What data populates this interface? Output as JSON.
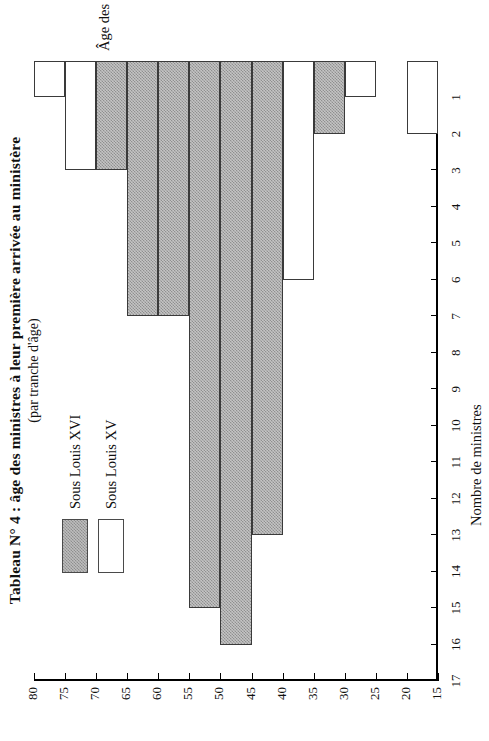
{
  "title": {
    "main": "Tableau N° 4 : âge des ministres à leur première arrivée au ministère",
    "sub": "(par tranche d'âge)"
  },
  "legend": {
    "items": [
      {
        "label": "Sous Louis XVI",
        "swatch": "gray"
      },
      {
        "label": "Sous Louis XV",
        "swatch": "white"
      }
    ]
  },
  "axes": {
    "value_axis_title": "Nombre de ministres",
    "category_axis_title": "Âge des ministres",
    "value_ticks": [
      "1",
      "2",
      "3",
      "4",
      "5",
      "6",
      "7",
      "8",
      "9",
      "10",
      "11",
      "12",
      "13",
      "14",
      "15",
      "16",
      "17"
    ],
    "category_ticks": [
      "15",
      "20",
      "25",
      "30",
      "35",
      "40",
      "45",
      "50",
      "55",
      "60",
      "65",
      "70",
      "75",
      "80"
    ]
  },
  "colors": {
    "louis_xvi": "#c4c4c4",
    "louis_xv": "#ffffff",
    "outline": "#3a3a3a",
    "axis": "#000000"
  },
  "chart_data": {
    "type": "bar",
    "orientation": "horizontal-rotated",
    "title": "Tableau N° 4 : âge des ministres à leur première arrivée au ministère",
    "subtitle": "(par tranche d'âge)",
    "xlabel": "Âge des ministres",
    "ylabel": "Nombre de ministres",
    "xlim": [
      15,
      80
    ],
    "ylim": [
      0,
      17
    ],
    "grid": false,
    "legend_position": "top-left",
    "categories": [
      "15-20",
      "20-25",
      "25-30",
      "30-35",
      "35-40",
      "40-45",
      "45-50",
      "50-55",
      "55-60",
      "60-65",
      "65-70",
      "70-75",
      "75-80"
    ],
    "bin_starts": [
      15,
      20,
      25,
      30,
      35,
      40,
      45,
      50,
      55,
      60,
      65,
      70,
      75
    ],
    "bin_width": 5,
    "series": [
      {
        "name": "Sous Louis XV",
        "values": [
          2,
          0,
          1,
          1,
          6,
          7,
          13,
          8,
          4,
          4,
          3,
          3,
          1
        ]
      },
      {
        "name": "Sous Louis XVI",
        "values": [
          0,
          0,
          0,
          2,
          0,
          13,
          16,
          15,
          7,
          7,
          3,
          0,
          0
        ]
      }
    ]
  }
}
